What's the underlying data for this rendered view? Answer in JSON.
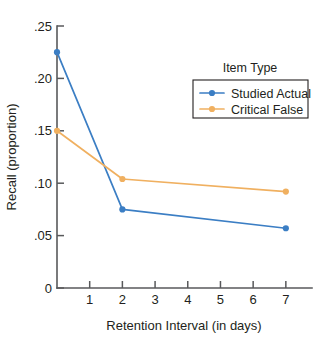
{
  "chart_data": {
    "type": "line",
    "title": "",
    "xlabel": "Retention Interval (in days)",
    "ylabel": "Recall (proportion)",
    "xlim": [
      0,
      7.8
    ],
    "ylim": [
      0,
      0.25
    ],
    "grid": false,
    "x": [
      0,
      2,
      7
    ],
    "xticks": [
      1,
      2,
      3,
      4,
      5,
      6,
      7
    ],
    "xtick_labels": [
      "1",
      "2",
      "3",
      "4",
      "5",
      "6",
      "7"
    ],
    "yticks": [
      0,
      0.05,
      0.1,
      0.15,
      0.2,
      0.25
    ],
    "ytick_labels": [
      "0",
      ".05",
      ".10",
      ".15",
      ".20",
      ".25"
    ],
    "legend_title": "Item Type",
    "legend_position": "upper right",
    "series": [
      {
        "name": "Studied Actual",
        "color": "#3b7ec4",
        "marker": "circle",
        "values": [
          0.225,
          0.075,
          0.057
        ]
      },
      {
        "name": "Critical False",
        "color": "#f0b060",
        "marker": "circle",
        "values": [
          0.15,
          0.104,
          0.092
        ]
      }
    ]
  },
  "axes": {
    "y_title": "Recall (proportion)",
    "x_title": "Retention Interval (in days)"
  },
  "legend": {
    "title": "Item Type",
    "entries": [
      {
        "label": "Studied Actual",
        "color": "#3b7ec4"
      },
      {
        "label": "Critical False",
        "color": "#f0b060"
      }
    ]
  },
  "colors": {
    "studied_actual": "#3b7ec4",
    "critical_false": "#f0b060",
    "axis": "#58595b",
    "text": "#231f20",
    "background": "#ffffff"
  }
}
